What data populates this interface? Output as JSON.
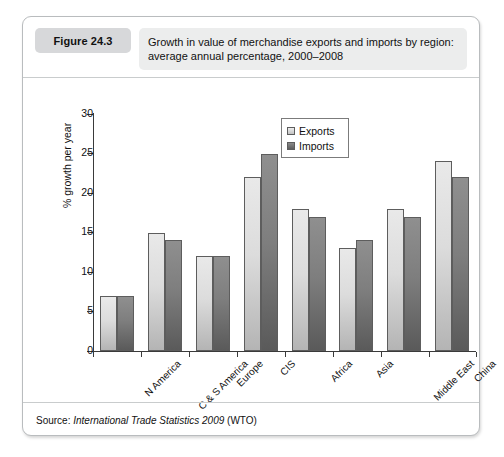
{
  "figure": {
    "badge": "Figure 24.3",
    "title": "Growth in value of merchandise exports and imports by region: average annual percentage, 2000–2008",
    "title_line1": "Growth in value of merchandise exports and imports by region:",
    "title_line2": "average annual percentage, 2000–2008",
    "source_prefix": "Source:",
    "source_italic": "International Trade Statistics 2009",
    "source_suffix": "(WTO)"
  },
  "legend": {
    "position": "inside-top-right",
    "entries": [
      {
        "label": "Exports",
        "color": "#dcdcdc"
      },
      {
        "label": "Imports",
        "color": "#7e7e7e"
      }
    ]
  },
  "axis": {
    "y_title": "% growth per year",
    "y_ticks": [
      "0",
      "5",
      "10",
      "15",
      "20",
      "25",
      "30"
    ],
    "x_labels": [
      "N America",
      "C & S America",
      "Europe",
      "CIS",
      "Africa",
      "Asia",
      "Middle East",
      "China"
    ]
  },
  "chart_data": {
    "type": "bar",
    "title": "Growth in value of merchandise exports and imports by region: average annual percentage, 2000–2008",
    "xlabel": "",
    "ylabel": "% growth per year",
    "ylim": [
      0,
      30
    ],
    "ytick_step": 5,
    "grid": false,
    "legend_position": "upper right inside plot",
    "categories": [
      "N America",
      "C & S America",
      "Europe",
      "CIS",
      "Africa",
      "Asia",
      "Middle East",
      "China"
    ],
    "series": [
      {
        "name": "Exports",
        "color": "#dcdcdc",
        "values": [
          7,
          15,
          12,
          22,
          18,
          13,
          18,
          24
        ]
      },
      {
        "name": "Imports",
        "color": "#7e7e7e",
        "values": [
          7,
          14,
          12,
          25,
          17,
          14,
          17,
          22
        ]
      }
    ],
    "source": "International Trade Statistics 2009 (WTO)"
  }
}
